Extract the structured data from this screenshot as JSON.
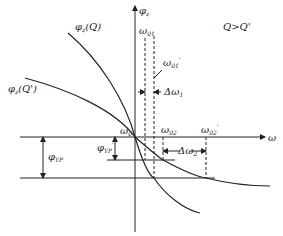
{
  "diagram": {
    "axes": {
      "y_label": "φ",
      "y_sub": "z",
      "x_label": "ω"
    },
    "condition": "Q>Q'",
    "curves": [
      {
        "label": "φ",
        "label_sub": "z",
        "label_arg": "(Q)"
      },
      {
        "label": "φ",
        "label_sub": "z",
        "label_arg": "(Q')"
      }
    ],
    "markers": {
      "omega0": {
        "sym": "ω",
        "sub": "0"
      },
      "omega01": {
        "sym": "ω",
        "sub": "01"
      },
      "omega01p": {
        "sym": "ω",
        "sub": "01",
        "prime": "'"
      },
      "delta_omega1": {
        "sym": "Δω",
        "sub": "1"
      },
      "omega02": {
        "sym": "ω",
        "sub": "02"
      },
      "omega02p": {
        "sym": "ω",
        "sub": "02",
        "prime": "'"
      },
      "delta_omega2": {
        "sym": "Δω",
        "sub": "2"
      },
      "phi_yp": {
        "sym": "φ",
        "sub": "YP"
      },
      "phi_yp_p": {
        "sym": "φ",
        "sub": "YP",
        "prime": "'"
      }
    }
  }
}
